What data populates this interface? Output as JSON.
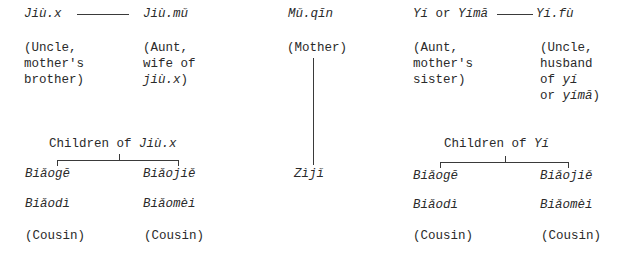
{
  "diagram": {
    "left_couple": {
      "husband": {
        "term": "Jiù.x",
        "gloss": [
          "(Uncle,",
          "mother's",
          "brother)"
        ]
      },
      "wife": {
        "term": "Jiù.mǔ",
        "gloss_1": "(Aunt,",
        "gloss_2": "wife of",
        "gloss_3_italic": "jiù.x",
        "gloss_3_end": ")"
      }
    },
    "center": {
      "mother": {
        "term": "Mǔ.qīn",
        "gloss": "(Mother)"
      },
      "self": {
        "term": "Zìjǐ"
      }
    },
    "right_couple": {
      "wife": {
        "term_a": "Yí",
        "or": " or ",
        "term_b": "Yímā",
        "gloss": [
          "(Aunt,",
          "mother's",
          "sister)"
        ]
      },
      "husband": {
        "term": "Yí.fù",
        "gloss_1": "(Uncle,",
        "gloss_2": "husband",
        "gloss_3": "of ",
        "gloss_3_italic": "yí",
        "gloss_4": "or ",
        "gloss_4_italic": "yímā",
        "gloss_4_end": ")"
      }
    },
    "left_children": {
      "heading": "Children of ",
      "heading_italic": "Jiù.x",
      "col1": [
        "Biǎogē",
        "Biǎodì",
        "(Cousin)"
      ],
      "col2": [
        "Biǎojiě",
        "Biǎomèi",
        "(Cousin)"
      ]
    },
    "right_children": {
      "heading": "Children of ",
      "heading_italic": "Yí",
      "col1": [
        "Biǎogē",
        "Biǎodì",
        "(Cousin)"
      ],
      "col2": [
        "Biǎojiě",
        "Biǎomèi",
        "(Cousin)"
      ]
    }
  }
}
